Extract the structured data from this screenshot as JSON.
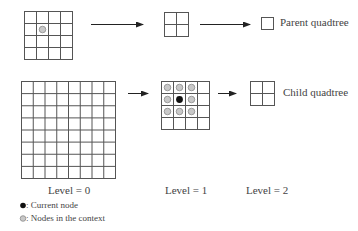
{
  "diagram": {
    "top_row": {
      "level0_grid": {
        "rows": 4,
        "cols": 4,
        "marked_cells": [
          {
            "row": 1,
            "col": 1,
            "type": "context"
          }
        ]
      },
      "level1_grid": {
        "rows": 2,
        "cols": 2
      },
      "level2_box": {
        "rows": 1,
        "cols": 1
      },
      "label": "Parent quadtree"
    },
    "bottom_row": {
      "level0_grid": {
        "rows": 8,
        "cols": 8
      },
      "level1_grid": {
        "rows": 4,
        "cols": 4,
        "marked_cells": [
          {
            "row": 0,
            "col": 0,
            "type": "context"
          },
          {
            "row": 0,
            "col": 1,
            "type": "context"
          },
          {
            "row": 0,
            "col": 2,
            "type": "context"
          },
          {
            "row": 1,
            "col": 0,
            "type": "context"
          },
          {
            "row": 1,
            "col": 1,
            "type": "current"
          },
          {
            "row": 1,
            "col": 2,
            "type": "context"
          },
          {
            "row": 2,
            "col": 0,
            "type": "context"
          },
          {
            "row": 2,
            "col": 1,
            "type": "context"
          },
          {
            "row": 2,
            "col": 2,
            "type": "context"
          }
        ]
      },
      "level2_grid": {
        "rows": 2,
        "cols": 2
      },
      "label": "Child quadtree"
    },
    "levels": [
      "Level = 0",
      "Level = 1",
      "Level = 2"
    ],
    "legend": {
      "current": "Current node",
      "context": "Nodes in the context",
      "separator": ": "
    },
    "colors": {
      "grid_line": "#555555",
      "current_node": "#111111",
      "context_node_fill": "#c8c8c8",
      "context_node_stroke": "#8a8a8a"
    }
  }
}
